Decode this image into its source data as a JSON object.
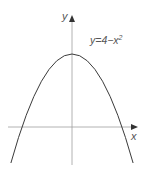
{
  "diagram": {
    "equation_label": "y=4−x",
    "equation_exponent": "2",
    "x_axis_label": "x",
    "y_axis_label": "y",
    "curve_color": "#3a3a3a",
    "axis_color": "#9a9a9a"
  }
}
